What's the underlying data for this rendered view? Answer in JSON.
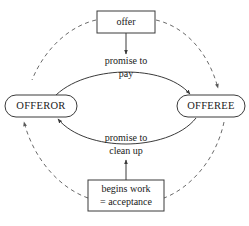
{
  "diagram": {
    "colors": {
      "background": "#ffffff",
      "stroke": "#3a3a3a",
      "dashed_stroke": "#6a6a6a",
      "text": "#1a1a1a"
    },
    "nodes": [
      {
        "id": "offer",
        "label": "offer",
        "shape": "rectangle",
        "x": 126,
        "y": 22
      },
      {
        "id": "offeror",
        "label": "OFFEROR",
        "shape": "rounded-oval",
        "x": 41,
        "y": 106
      },
      {
        "id": "offeree",
        "label": "OFFEREE",
        "shape": "rounded-oval",
        "x": 211,
        "y": 106
      },
      {
        "id": "begins-work",
        "label_line1": "begins work",
        "label_line2": "= acceptance",
        "shape": "rectangle",
        "x": 126,
        "y": 195
      }
    ],
    "edge_labels": [
      {
        "id": "promise-to-pay",
        "line1": "promise to",
        "line2": "pay",
        "x": 126,
        "y": 66
      },
      {
        "id": "promise-to-clean-up",
        "line1": "promise to",
        "line2": "clean up",
        "x": 126,
        "y": 142
      }
    ],
    "edges": [
      {
        "id": "offer-to-promise-pay",
        "style": "solid",
        "from": "offer",
        "to": "promise-to-pay",
        "arrow": "end"
      },
      {
        "id": "offeror-to-offeree-pay",
        "style": "solid",
        "from": "offeror",
        "to": "offeree",
        "arrow": "end",
        "curve": "upper"
      },
      {
        "id": "offeree-to-offeror-clean-up",
        "style": "solid",
        "from": "offeree",
        "to": "offeror",
        "arrow": "end",
        "curve": "lower"
      },
      {
        "id": "begins-work-to-promise-clean-up",
        "style": "solid",
        "from": "begins-work",
        "to": "promise-to-clean-up",
        "arrow": "end"
      },
      {
        "id": "dashed-cycle-right",
        "style": "dashed",
        "from": "offer",
        "to": "offeree",
        "arrow": "end"
      },
      {
        "id": "dashed-cycle-bottom-left",
        "style": "dashed",
        "from": "begins-work",
        "to": "offeror",
        "arrow": "end"
      },
      {
        "id": "dashed-cycle-top-left",
        "style": "dashed",
        "from": "offeror",
        "to": "offer",
        "arrow": "none"
      },
      {
        "id": "dashed-cycle-bottom-right",
        "style": "dashed",
        "from": "offeree",
        "to": "begins-work",
        "arrow": "none"
      }
    ]
  }
}
